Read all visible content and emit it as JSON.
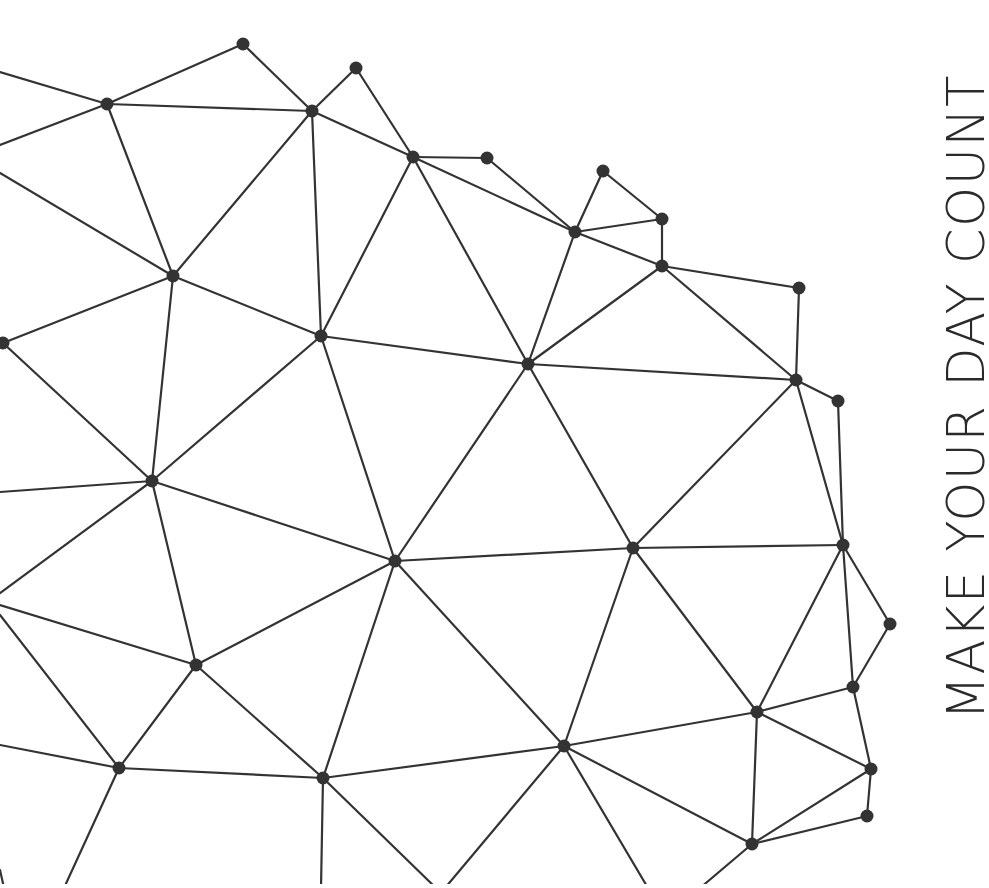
{
  "tagline": {
    "text": "MAKE YOUR DAY COUNT",
    "color": "#2a2a2a",
    "orientation": "rotated 90deg counter-clockwise, reading bottom-to-top"
  },
  "network": {
    "stroke_color": "#333333",
    "node_color": "#333333",
    "node_radius": 6.5,
    "nodes": [
      {
        "id": "A",
        "x": 243,
        "y": 44
      },
      {
        "id": "B",
        "x": 356,
        "y": 68
      },
      {
        "id": "C",
        "x": 107,
        "y": 104
      },
      {
        "id": "D",
        "x": 312,
        "y": 111
      },
      {
        "id": "E",
        "x": 413,
        "y": 157
      },
      {
        "id": "F",
        "x": 487,
        "y": 158
      },
      {
        "id": "G",
        "x": 603,
        "y": 171
      },
      {
        "id": "I",
        "x": 662,
        "y": 219
      },
      {
        "id": "H",
        "x": 575,
        "y": 232
      },
      {
        "id": "J",
        "x": 662,
        "y": 266
      },
      {
        "id": "K",
        "x": 173,
        "y": 276
      },
      {
        "id": "O",
        "x": 799,
        "y": 288
      },
      {
        "id": "L",
        "x": 321,
        "y": 336
      },
      {
        "id": "M",
        "x": 3,
        "y": 343
      },
      {
        "id": "N",
        "x": 528,
        "y": 364
      },
      {
        "id": "P",
        "x": 796,
        "y": 380
      },
      {
        "id": "Q",
        "x": 838,
        "y": 401
      },
      {
        "id": "R",
        "x": 152,
        "y": 481
      },
      {
        "id": "U",
        "x": 843,
        "y": 545
      },
      {
        "id": "T",
        "x": 633,
        "y": 548
      },
      {
        "id": "S",
        "x": 395,
        "y": 561
      },
      {
        "id": "V",
        "x": 890,
        "y": 624
      },
      {
        "id": "W",
        "x": 196,
        "y": 665
      },
      {
        "id": "X",
        "x": 853,
        "y": 687
      },
      {
        "id": "Y",
        "x": 757,
        "y": 712
      },
      {
        "id": "AB",
        "x": 564,
        "y": 746
      },
      {
        "id": "Z",
        "x": 119,
        "y": 768
      },
      {
        "id": "AC",
        "x": 871,
        "y": 769
      },
      {
        "id": "AA",
        "x": 323,
        "y": 778
      },
      {
        "id": "AD",
        "x": 867,
        "y": 816
      },
      {
        "id": "AE",
        "x": 752,
        "y": 844
      }
    ],
    "edges": [
      [
        0,
        72,
        107,
        104
      ],
      [
        0,
        145,
        107,
        104
      ],
      [
        107,
        104,
        243,
        44
      ],
      [
        107,
        104,
        312,
        111
      ],
      [
        107,
        104,
        173,
        276
      ],
      [
        0,
        173,
        173,
        276
      ],
      [
        243,
        44,
        312,
        111
      ],
      [
        312,
        111,
        356,
        68
      ],
      [
        356,
        68,
        413,
        157
      ],
      [
        312,
        111,
        413,
        157
      ],
      [
        312,
        111,
        173,
        276
      ],
      [
        312,
        111,
        321,
        336
      ],
      [
        413,
        157,
        487,
        158
      ],
      [
        487,
        158,
        575,
        232
      ],
      [
        413,
        157,
        575,
        232
      ],
      [
        413,
        157,
        321,
        336
      ],
      [
        413,
        157,
        528,
        364
      ],
      [
        575,
        232,
        603,
        171
      ],
      [
        603,
        171,
        662,
        219
      ],
      [
        575,
        232,
        662,
        219
      ],
      [
        662,
        219,
        662,
        266
      ],
      [
        575,
        232,
        662,
        266
      ],
      [
        575,
        232,
        528,
        364
      ],
      [
        662,
        266,
        528,
        364
      ],
      [
        662,
        266,
        799,
        288
      ],
      [
        662,
        266,
        796,
        380
      ],
      [
        799,
        288,
        796,
        380
      ],
      [
        796,
        380,
        838,
        401
      ],
      [
        528,
        364,
        796,
        380
      ],
      [
        633,
        548,
        796,
        380
      ],
      [
        796,
        380,
        843,
        545
      ],
      [
        838,
        401,
        843,
        545
      ],
      [
        173,
        276,
        321,
        336
      ],
      [
        3,
        343,
        173,
        276
      ],
      [
        173,
        276,
        152,
        481
      ],
      [
        3,
        343,
        152,
        481
      ],
      [
        321,
        336,
        528,
        364
      ],
      [
        321,
        336,
        152,
        481
      ],
      [
        321,
        336,
        395,
        561
      ],
      [
        528,
        364,
        395,
        561
      ],
      [
        528,
        364,
        633,
        548
      ],
      [
        0,
        492,
        152,
        481
      ],
      [
        0,
        593,
        152,
        481
      ],
      [
        152,
        481,
        395,
        561
      ],
      [
        152,
        481,
        196,
        665
      ],
      [
        395,
        561,
        633,
        548
      ],
      [
        395,
        561,
        196,
        665
      ],
      [
        395,
        561,
        323,
        778
      ],
      [
        395,
        561,
        564,
        746
      ],
      [
        633,
        548,
        843,
        545
      ],
      [
        633,
        548,
        564,
        746
      ],
      [
        633,
        548,
        757,
        712
      ],
      [
        843,
        545,
        890,
        624
      ],
      [
        843,
        545,
        853,
        687
      ],
      [
        843,
        545,
        757,
        712
      ],
      [
        890,
        624,
        853,
        687
      ],
      [
        853,
        687,
        757,
        712
      ],
      [
        853,
        687,
        871,
        769
      ],
      [
        757,
        712,
        871,
        769
      ],
      [
        757,
        712,
        752,
        844
      ],
      [
        757,
        712,
        564,
        746
      ],
      [
        871,
        769,
        867,
        816
      ],
      [
        871,
        769,
        752,
        844
      ],
      [
        867,
        816,
        752,
        844
      ],
      [
        564,
        746,
        323,
        778
      ],
      [
        564,
        746,
        752,
        844
      ],
      [
        564,
        746,
        445,
        888
      ],
      [
        564,
        746,
        648,
        888
      ],
      [
        752,
        844,
        700,
        888
      ],
      [
        0,
        605,
        196,
        665
      ],
      [
        196,
        665,
        119,
        768
      ],
      [
        196,
        665,
        323,
        778
      ],
      [
        0,
        615,
        119,
        768
      ],
      [
        0,
        745,
        119,
        768
      ],
      [
        119,
        768,
        323,
        778
      ],
      [
        119,
        768,
        64,
        888
      ],
      [
        323,
        778,
        321,
        888
      ],
      [
        323,
        778,
        436,
        888
      ],
      [
        0,
        870,
        4,
        888
      ]
    ]
  }
}
